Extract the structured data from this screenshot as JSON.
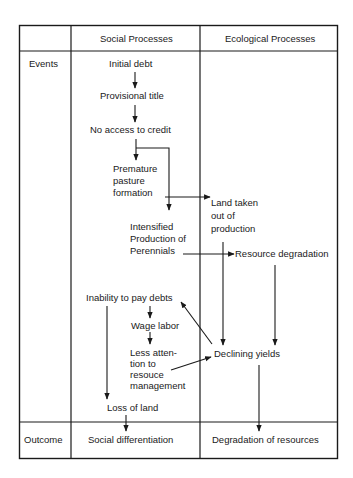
{
  "table": {
    "headers": {
      "corner": "",
      "social": "Social Processes",
      "ecological": "Ecological Processes"
    },
    "rows": {
      "events": "Events",
      "outcome": "Outcome"
    }
  },
  "nodes": {
    "initial_debt": "Initial debt",
    "provisional_title": "Provisional title",
    "no_access_to_credit": "No access to credit",
    "premature_pasture": [
      "Premature",
      "pasture",
      "formation"
    ],
    "intensified_production": [
      "Intensified",
      "Production of",
      "Perennials"
    ],
    "land_taken_out": [
      "Land taken",
      "out of",
      "production"
    ],
    "resource_degradation": "Resource degradation",
    "inability_to_pay": "Inability to pay debts",
    "wage_labor": "Wage labor",
    "less_attention": [
      "Less atten-",
      "tion to",
      "resouce",
      "management"
    ],
    "declining_yields": "Declining yields",
    "loss_of_land": "Loss of land",
    "social_differentiation": "Social differentiation",
    "degradation_of_resources": "Degradation of resources"
  },
  "edges": [
    {
      "from": "Initial debt",
      "to": "Provisional title"
    },
    {
      "from": "Provisional title",
      "to": "No access to credit"
    },
    {
      "from": "No access to credit",
      "to": "Premature pasture formation"
    },
    {
      "from": "No access to credit",
      "to": "Intensified Production of Perennials"
    },
    {
      "from": "Premature pasture formation",
      "to": "Land taken out of production"
    },
    {
      "from": "Intensified Production of Perennials",
      "to": "Resource degradation"
    },
    {
      "from": "Land taken out of production",
      "to": "Declining yields"
    },
    {
      "from": "Resource degradation",
      "to": "Declining yields"
    },
    {
      "from": "Declining yields",
      "to": "Inability to pay debts"
    },
    {
      "from": "Inability to pay debts",
      "to": "Wage labor"
    },
    {
      "from": "Wage labor",
      "to": "Less attention to resouce management"
    },
    {
      "from": "Less attention to resouce management",
      "to": "Declining yields"
    },
    {
      "from": "Inability to pay debts",
      "to": "Loss of land"
    },
    {
      "from": "Loss of land",
      "to": "Social differentiation"
    },
    {
      "from": "Declining yields",
      "to": "Degradation of resources"
    }
  ],
  "colors": {
    "line": "#1a1a1a",
    "background": "#ffffff"
  }
}
